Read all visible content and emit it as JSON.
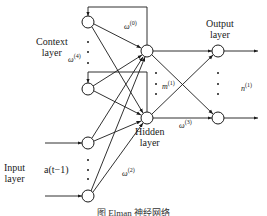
{
  "diagram": {
    "type": "Elman neural network",
    "layers": {
      "context": {
        "label_line1": "Context",
        "label_line2": "layer"
      },
      "input": {
        "label_line1": "Input",
        "label_line2": "layer",
        "signal": "a(t−1)"
      },
      "hidden": {
        "label_line1": "Hidden",
        "label_line2": "layer"
      },
      "output": {
        "label_line1": "Output",
        "label_line2": "layer"
      }
    },
    "weights": {
      "w0": {
        "symbol": "ω",
        "sup": "(0)"
      },
      "w4": {
        "symbol": "ω",
        "sup": "(4)"
      },
      "w2": {
        "symbol": "ω",
        "sup": "(2)"
      },
      "w3": {
        "symbol": "ω",
        "sup": "(3)"
      },
      "m1": {
        "symbol": "m",
        "sup": "(1)"
      },
      "n1": {
        "symbol": "n",
        "sup": "(1)"
      }
    },
    "caption": "图      Elman 神经网络",
    "colors": {
      "stroke": "#1a1a1a",
      "background": "#ffffff"
    }
  }
}
